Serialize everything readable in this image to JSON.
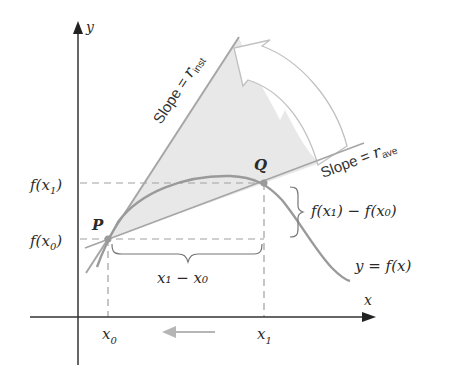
{
  "figure": {
    "axes": {
      "x_label": "x",
      "y_label": "y"
    },
    "points": {
      "P": "P",
      "Q": "Q"
    },
    "ticks": {
      "x0_base": "x",
      "x0_sub": "0",
      "x1_base": "x",
      "x1_sub": "1",
      "fx1": "f(x",
      "fx1_sub": "1",
      "fx0": "f(x",
      "fx0_sub": "0",
      "close_paren": ")"
    },
    "labels": {
      "slope_inst_prefix": "Slope = ",
      "slope_inst_r": "r",
      "slope_inst_sub": "inst",
      "slope_ave_prefix": "Slope = ",
      "slope_ave_r": "r",
      "slope_ave_sub": "ave",
      "dy_label": "f(x₁) − f(x₀)",
      "dx_label": "x₁ − x₀",
      "curve_label": "y = f(x)"
    },
    "colors": {
      "axis": "#333333",
      "curve": "#9a9a9a",
      "lines": "#a8a8a8",
      "shade": "#e6e6e6",
      "arrow": "#bdbdbd",
      "dash": "#a0a0a0"
    }
  }
}
